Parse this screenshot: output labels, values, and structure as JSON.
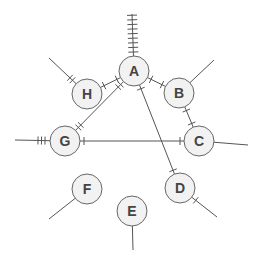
{
  "diagram": {
    "type": "graph",
    "stroke_color": "#555555",
    "node_fill": "#f2f2f2",
    "node_stroke": "#666666",
    "label_color": "#444444",
    "node_radius": 15,
    "nodes": [
      {
        "id": "A",
        "label": "A",
        "x": 134,
        "y": 71
      },
      {
        "id": "B",
        "label": "B",
        "x": 179,
        "y": 93
      },
      {
        "id": "C",
        "label": "C",
        "x": 199,
        "y": 141
      },
      {
        "id": "D",
        "label": "D",
        "x": 180,
        "y": 188
      },
      {
        "id": "E",
        "label": "E",
        "x": 132,
        "y": 211
      },
      {
        "id": "F",
        "label": "F",
        "x": 87,
        "y": 189
      },
      {
        "id": "G",
        "label": "G",
        "x": 65,
        "y": 141
      },
      {
        "id": "H",
        "label": "H",
        "x": 87,
        "y": 94
      }
    ],
    "edges": [
      {
        "from": "A",
        "to": "H",
        "ticks": 1
      },
      {
        "from": "A",
        "to": "B",
        "ticks": 1
      },
      {
        "from": "A",
        "to": "G",
        "ticks": 2
      },
      {
        "from": "A",
        "to": "D",
        "ticks": 1
      },
      {
        "from": "B",
        "to": "C",
        "ticks": 1
      },
      {
        "from": "G",
        "to": "C",
        "ticks": 1
      }
    ],
    "rays": [
      {
        "node": "A",
        "x2": 132,
        "y2": 14,
        "ticks": 9
      },
      {
        "node": "H",
        "x2": 49,
        "y2": 58,
        "ticks": 2
      },
      {
        "node": "B",
        "x2": 214,
        "y2": 60,
        "ticks": 0
      },
      {
        "node": "C",
        "x2": 248,
        "y2": 145,
        "ticks": 0
      },
      {
        "node": "G",
        "x2": 15,
        "y2": 140,
        "ticks": 3
      },
      {
        "node": "D",
        "x2": 217,
        "y2": 217,
        "ticks": 1
      },
      {
        "node": "E",
        "x2": 133,
        "y2": 250,
        "ticks": 0
      },
      {
        "node": "F",
        "x2": 49,
        "y2": 219,
        "ticks": 0
      }
    ]
  }
}
